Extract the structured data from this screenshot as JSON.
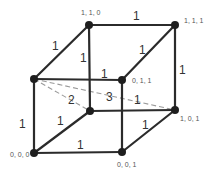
{
  "diagram": {
    "type": "unit-cube-graph",
    "vertices": [
      {
        "id": "A",
        "x": 34,
        "y": 79,
        "label": ""
      },
      {
        "id": "B",
        "x": 89,
        "y": 25,
        "label": "1, 1, 0"
      },
      {
        "id": "C",
        "x": 175,
        "y": 25,
        "label": "1, 1, 1"
      },
      {
        "id": "D",
        "x": 122,
        "y": 80,
        "label": "0, 1, 1"
      },
      {
        "id": "E",
        "x": 90,
        "y": 111,
        "label": ""
      },
      {
        "id": "F",
        "x": 175,
        "y": 110,
        "label": "1, 0, 1"
      },
      {
        "id": "G",
        "x": 34,
        "y": 153,
        "label": "0, 0, 0"
      },
      {
        "id": "H",
        "x": 122,
        "y": 152,
        "label": "0, 0, 1"
      }
    ],
    "edges": [
      {
        "from": "A",
        "to": "B",
        "weight": "1"
      },
      {
        "from": "B",
        "to": "C",
        "weight": "1"
      },
      {
        "from": "A",
        "to": "D",
        "weight": "1"
      },
      {
        "from": "B",
        "to": "E",
        "weight": "1"
      },
      {
        "from": "C",
        "to": "D",
        "weight": "1"
      },
      {
        "from": "C",
        "to": "F",
        "weight": "1"
      },
      {
        "from": "D",
        "to": "H",
        "weight": ""
      },
      {
        "from": "E",
        "to": "F",
        "weight": ""
      },
      {
        "from": "A",
        "to": "G",
        "weight": "1"
      },
      {
        "from": "G",
        "to": "E",
        "weight": "1"
      },
      {
        "from": "G",
        "to": "H",
        "weight": "1"
      },
      {
        "from": "H",
        "to": "F",
        "weight": "1"
      }
    ],
    "dashed_edges": [
      {
        "from": "A",
        "to": "E",
        "weight": "2"
      },
      {
        "from": "A",
        "to": "F",
        "weight": "3"
      },
      {
        "from": "A",
        "to": "F",
        "segment_weight": "1"
      }
    ],
    "labels": {
      "coord_B": "1, 1, 0",
      "coord_C": "1, 1, 1",
      "coord_D": "0, 1, 1",
      "coord_F": "1, 0, 1",
      "coord_G": "0, 0, 0",
      "coord_H": "0, 0, 1",
      "w_AB": "1",
      "w_BC": "1",
      "w_BE": "1",
      "w_AD": "1",
      "w_CD": "1",
      "w_CF": "1",
      "w_AG": "1",
      "w_GE": "1",
      "w_GH": "1",
      "w_HF": "1",
      "w_AE_dashed": "2",
      "w_AF_dashed": "3",
      "w_AF_dashed_tail": "1"
    }
  }
}
